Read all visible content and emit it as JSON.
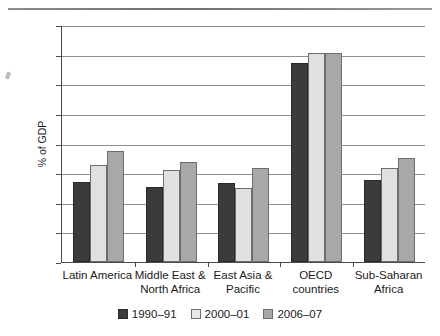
{
  "chart_data": {
    "type": "bar",
    "title": "",
    "xlabel": "",
    "ylabel": "% of GDP",
    "ylim": [
      0,
      40
    ],
    "ytick_step": 5,
    "ytick_labels": [
      "0,0",
      "5,0",
      "10,0",
      "15,0",
      "20,0",
      "25,0",
      "30,0",
      "35,0",
      "40,0"
    ],
    "grid": true,
    "legend_position": "bottom",
    "categories": [
      "Latin America",
      "Middle East &\nNorth Africa",
      "East Asia &\nPacific",
      "OECD\ncountries",
      "Sub-Saharan\nAfrica"
    ],
    "category_lines": [
      [
        "Latin America",
        ""
      ],
      [
        "Middle East &",
        "North Africa"
      ],
      [
        "East Asia &",
        "Pacific"
      ],
      [
        "OECD",
        "countries"
      ],
      [
        "Sub-Saharan",
        "Africa"
      ]
    ],
    "series": [
      {
        "name": "1990–91",
        "color": "#3b3b3b",
        "values": [
          13.5,
          12.7,
          13.3,
          33.6,
          13.8
        ]
      },
      {
        "name": "2000–01",
        "color": "#e0e0e0",
        "values": [
          16.4,
          15.5,
          12.5,
          35.3,
          15.9
        ]
      },
      {
        "name": "2006–07",
        "color": "#a8a8a8",
        "values": [
          18.7,
          16.8,
          15.9,
          35.2,
          17.5
        ]
      }
    ]
  },
  "legend": {
    "items": [
      {
        "label": "1990–91"
      },
      {
        "label": "2000–01"
      },
      {
        "label": "2006–07"
      }
    ]
  },
  "axis": {
    "y_title": "% of GDP"
  }
}
